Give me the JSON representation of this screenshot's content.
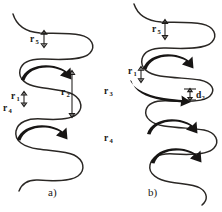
{
  "figure": {
    "background_color": "#ffffff",
    "ink_color": "#2a2724",
    "width": 222,
    "height": 212
  },
  "panels": [
    {
      "id": "panel-a",
      "caption": "a)",
      "caption_x": 48,
      "caption_y": 196,
      "labels": [
        {
          "name": "label-r5",
          "base": "r",
          "sub": "5",
          "x": 30,
          "y": 42,
          "sub_dx": 5.6,
          "sub_dy": 2.4
        },
        {
          "name": "label-r1",
          "base": "r",
          "sub": "1",
          "x": 11,
          "y": 99,
          "sub_dx": 5.6,
          "sub_dy": 2.4
        },
        {
          "name": "label-r2",
          "base": "r",
          "sub": "2",
          "x": 61,
          "y": 95,
          "sub_dx": 5.6,
          "sub_dy": 2.4
        },
        {
          "name": "label-r4",
          "base": "r",
          "sub": "4",
          "x": 3,
          "y": 111,
          "sub_dx": 5.6,
          "sub_dy": 2.4
        }
      ],
      "dimensions": [
        {
          "name": "dim-r5",
          "orientation": "vertical",
          "x": 44,
          "y1": 31,
          "y2": 47
        },
        {
          "name": "dim-r1",
          "orientation": "vertical",
          "x": 24,
          "y1": 92,
          "y2": 106
        },
        {
          "name": "dim-r2",
          "orientation": "vertical",
          "x": 72,
          "y1": 71,
          "y2": 117
        }
      ],
      "flow_arrows": [
        {
          "name": "flow-arrow-upper",
          "direction": "clockwise-right"
        },
        {
          "name": "flow-arrow-lower",
          "direction": "clockwise-right"
        }
      ]
    },
    {
      "id": "panel-b",
      "caption": "b)",
      "caption_x": 148,
      "caption_y": 196,
      "labels": [
        {
          "name": "label-r5",
          "base": "r",
          "sub": "5",
          "x": 152,
          "y": 32,
          "sub_dx": 5.6,
          "sub_dy": 2.4
        },
        {
          "name": "label-r1",
          "base": "r",
          "sub": "1",
          "x": 128,
          "y": 74,
          "sub_dx": 5.6,
          "sub_dy": 2.4
        },
        {
          "name": "label-r3",
          "base": "r",
          "sub": "3",
          "x": 104,
          "y": 94,
          "sub_dx": 5.6,
          "sub_dy": 2.4
        },
        {
          "name": "label-d2",
          "base": "d",
          "sub": "2",
          "x": 196,
          "y": 98,
          "sub_dx": 5.6,
          "sub_dy": 2.4
        },
        {
          "name": "label-r4",
          "base": "r",
          "sub": "4",
          "x": 104,
          "y": 141,
          "sub_dx": 5.6,
          "sub_dy": 2.4
        }
      ],
      "dimensions": [
        {
          "name": "dim-r5",
          "orientation": "vertical",
          "x": 165,
          "y1": 20,
          "y2": 39
        },
        {
          "name": "dim-r1",
          "orientation": "vertical",
          "x": 141,
          "y1": 67,
          "y2": 82
        },
        {
          "name": "dim-d2",
          "orientation": "vertical",
          "x": 190,
          "y1": 89,
          "y2": 100
        }
      ],
      "flow_arrows": [
        {
          "name": "flow-arrow-upper",
          "direction": "clockwise-right"
        },
        {
          "name": "flow-arrow-middle",
          "direction": "clockwise-right"
        },
        {
          "name": "flow-arrow-lower",
          "direction": "clockwise-right"
        }
      ]
    }
  ]
}
